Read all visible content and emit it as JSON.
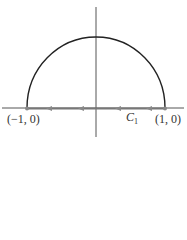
{
  "diagram": {
    "labels": {
      "left_point": "(−1, 0)",
      "right_point": "(1, 0)",
      "contour_name": "C",
      "contour_subscript": "1"
    },
    "colors": {
      "curve": "#222222",
      "axis": "#555555",
      "segment": "#777777",
      "arrow": "#888888"
    },
    "arrows_direction": "left",
    "arrow_positions_x": [
      49,
      81,
      118,
      149
    ]
  }
}
